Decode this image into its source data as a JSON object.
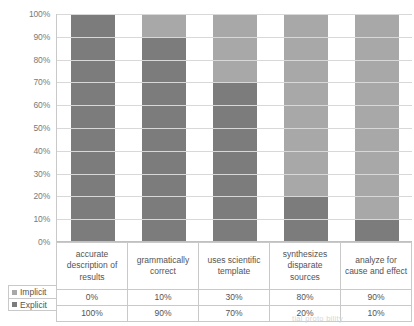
{
  "chart_data": {
    "type": "bar",
    "subtype": "stacked-100-percent",
    "title": "",
    "xlabel": "",
    "ylabel": "",
    "ylim": [
      0,
      100
    ],
    "grid": true,
    "legend_position": "table-left-column",
    "categories": [
      "accurate description of results",
      "grammatically correct",
      "uses scientific template",
      "synthesizes disparate sources",
      "analyze for cause and effect"
    ],
    "ytick_labels": [
      "100%",
      "90%",
      "80%",
      "70%",
      "60%",
      "50%",
      "40%",
      "30%",
      "20%",
      "10%",
      "0%"
    ],
    "ytick_values": [
      100,
      90,
      80,
      70,
      60,
      50,
      40,
      30,
      20,
      10,
      0
    ],
    "series": [
      {
        "name": "Implicit",
        "color": "#a8a8a8",
        "values": [
          0,
          10,
          30,
          80,
          90
        ],
        "labels": [
          "0%",
          "10%",
          "30%",
          "80%",
          "90%"
        ]
      },
      {
        "name": "Explicit",
        "color": "#7c7c7c",
        "values": [
          100,
          90,
          70,
          20,
          10
        ],
        "labels": [
          "100%",
          "90%",
          "70%",
          "20%",
          "10%"
        ]
      }
    ]
  },
  "table": {
    "headers": [
      "accurate description of results",
      "grammatically correct",
      "uses scientific template",
      "synthesizes disparate sources",
      "analyze for cause and effect"
    ],
    "rows": [
      {
        "label": "Implicit",
        "swatch": "implicit",
        "cells": [
          "0%",
          "10%",
          "30%",
          "80%",
          "90%"
        ]
      },
      {
        "label": "Explicit",
        "swatch": "explicit",
        "cells": [
          "100%",
          "90%",
          "70%",
          "20%",
          "10%"
        ]
      }
    ]
  },
  "footer": {
    "fragment": "tial proto bility"
  }
}
